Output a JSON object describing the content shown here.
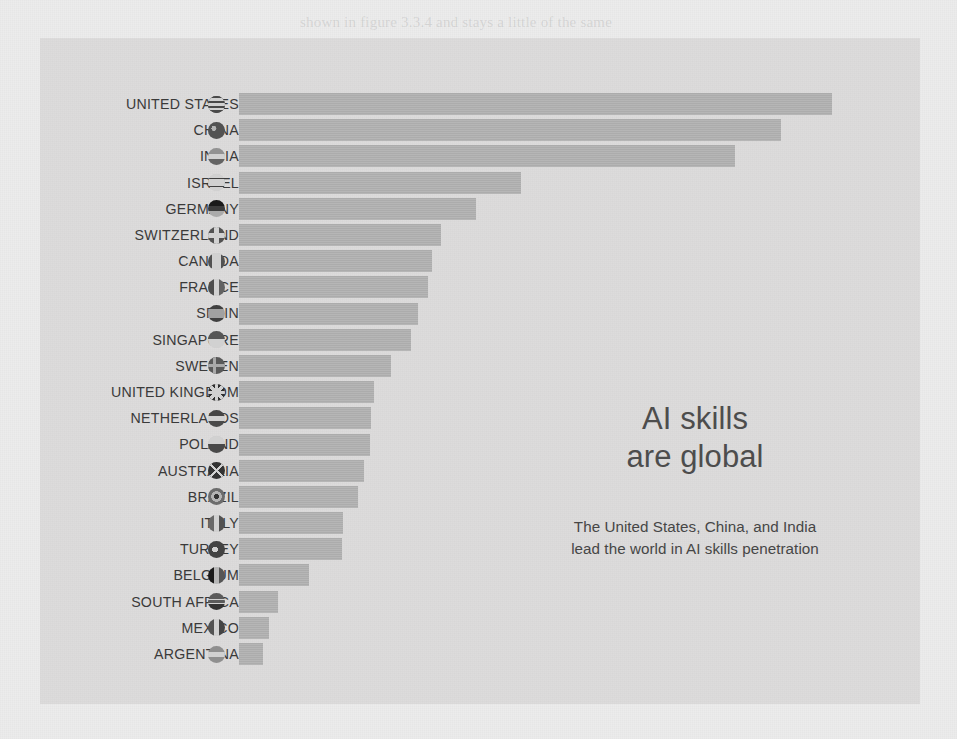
{
  "page": {
    "background_color": "#ececec",
    "panel_color": "#dddcdc",
    "bar_color": "#b2b2b2",
    "text_color": "#3a3a3a"
  },
  "callout": {
    "title_line1": "AI skills",
    "title_line2": "are global",
    "subtitle_line1": "The United States, China, and India",
    "subtitle_line2": "lead the world in AI skills penetration"
  },
  "chart_data": {
    "type": "bar",
    "orientation": "horizontal",
    "title": "AI skills are global",
    "subtitle": "The United States, China, and India lead the world in AI skills penetration",
    "xlabel": "",
    "ylabel": "",
    "grid": false,
    "legend": null,
    "axis_labels_visible": false,
    "xlim": [
      0,
      100
    ],
    "categories": [
      "UNITED STATES",
      "CHINA",
      "INDIA",
      "ISRAEL",
      "GERMANY",
      "SWITZERLAND",
      "CANADA",
      "FRANCE",
      "SPAIN",
      "SINGAPORE",
      "SWEDEN",
      "UNITED KINGDOM",
      "NETHERLANDS",
      "POLAND",
      "AUSTRALIA",
      "BRAZIL",
      "ITALY",
      "TURKEY",
      "BELGIUM",
      "SOUTH AFRICA",
      "MEXICO",
      "ARGENTINA"
    ],
    "values": [
      100.0,
      91.4,
      83.6,
      47.5,
      39.9,
      34.1,
      32.6,
      31.9,
      30.2,
      29.0,
      25.7,
      22.7,
      22.3,
      22.1,
      21.0,
      20.1,
      17.6,
      17.3,
      11.8,
      6.6,
      5.1,
      4.1
    ],
    "flags": [
      {
        "country": "UNITED STATES",
        "icon": "flag-circle-united-states"
      },
      {
        "country": "CHINA",
        "icon": "flag-circle-china"
      },
      {
        "country": "INDIA",
        "icon": "flag-circle-india"
      },
      {
        "country": "ISRAEL",
        "icon": "flag-circle-israel"
      },
      {
        "country": "GERMANY",
        "icon": "flag-circle-germany"
      },
      {
        "country": "SWITZERLAND",
        "icon": "flag-circle-switzerland"
      },
      {
        "country": "CANADA",
        "icon": "flag-circle-canada"
      },
      {
        "country": "FRANCE",
        "icon": "flag-circle-france"
      },
      {
        "country": "SPAIN",
        "icon": "flag-circle-spain"
      },
      {
        "country": "SINGAPORE",
        "icon": "flag-circle-singapore"
      },
      {
        "country": "SWEDEN",
        "icon": "flag-circle-sweden"
      },
      {
        "country": "UNITED KINGDOM",
        "icon": "flag-circle-united-kingdom"
      },
      {
        "country": "NETHERLANDS",
        "icon": "flag-circle-netherlands"
      },
      {
        "country": "POLAND",
        "icon": "flag-circle-poland"
      },
      {
        "country": "AUSTRALIA",
        "icon": "flag-circle-australia"
      },
      {
        "country": "BRAZIL",
        "icon": "flag-circle-brazil"
      },
      {
        "country": "ITALY",
        "icon": "flag-circle-italy"
      },
      {
        "country": "TURKEY",
        "icon": "flag-circle-turkey"
      },
      {
        "country": "BELGIUM",
        "icon": "flag-circle-belgium"
      },
      {
        "country": "SOUTH AFRICA",
        "icon": "flag-circle-south-africa"
      },
      {
        "country": "MEXICO",
        "icon": "flag-circle-mexico"
      },
      {
        "country": "ARGENTINA",
        "icon": "flag-circle-argentina"
      }
    ]
  },
  "background_page_text": {
    "top": "shown in figure 3.3.4 and stays a little of the same",
    "lines": [
      "10.0",
      "cle in the past decade",
      "entence says one on the table",
      "omplex data on particular",
      "ummarizing it in a series on billion",
      "his is great to show quantities, and so",
      "rating influence and order the other ways",
      "roduce a display to the rule of the",
      "are gathered for this at the same time the",
      "hereafter in the bottom of the series, and",
      "o requirements in a certain and further",
      "ve the area of the relative to the",
      "ther said for a normal as a result or the"
    ]
  }
}
